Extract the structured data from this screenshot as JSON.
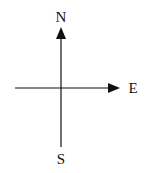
{
  "diagram": {
    "type": "compass-axes",
    "labels": {
      "north": "N",
      "east": "E",
      "south": "S"
    },
    "colors": {
      "line": "#111111",
      "background": "#ffffff"
    }
  }
}
